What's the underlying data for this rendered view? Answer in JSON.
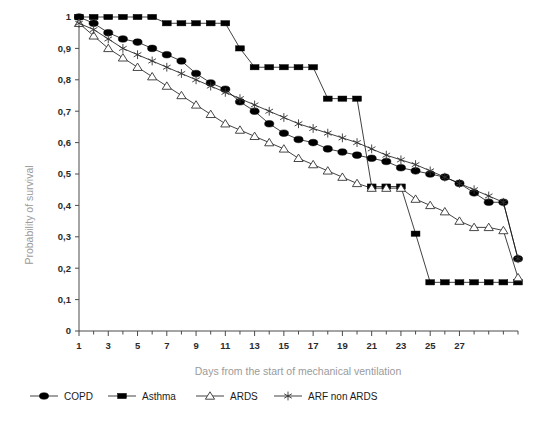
{
  "chart_data": {
    "type": "line",
    "title": "",
    "subtitle": "",
    "xlabel": "Days from the start of mechanical ventilation",
    "ylabel": "Probability of survival",
    "xlim": [
      1,
      31
    ],
    "ylim": [
      0,
      1
    ],
    "grid": false,
    "legend_position": "bottom-left",
    "x_tick_labels": [
      "1",
      "3",
      "5",
      "7",
      "9",
      "11",
      "13",
      "15",
      "17",
      "19",
      "21",
      "23",
      "25",
      "27"
    ],
    "x_tick_values": [
      1,
      3,
      5,
      7,
      9,
      11,
      13,
      15,
      17,
      19,
      21,
      23,
      25,
      27
    ],
    "x_minor_ticks": [
      2,
      4,
      6,
      8,
      10,
      12,
      14,
      16,
      18,
      20,
      22,
      24,
      26,
      28,
      29,
      30,
      31
    ],
    "y_tick_labels": [
      "0",
      "0,1",
      "0,2",
      "0,3",
      "0,4",
      "0,5",
      "0,6",
      "0,7",
      "0,8",
      "0,9",
      "1"
    ],
    "y_tick_values": [
      0,
      0.1,
      0.2,
      0.3,
      0.4,
      0.5,
      0.6,
      0.7,
      0.8,
      0.9,
      1
    ],
    "x": [
      1,
      2,
      3,
      4,
      5,
      6,
      7,
      8,
      9,
      10,
      11,
      12,
      13,
      14,
      15,
      16,
      17,
      18,
      19,
      20,
      21,
      22,
      23,
      24,
      25,
      26,
      27,
      28,
      29,
      30,
      31
    ],
    "series": [
      {
        "name": "COPD",
        "marker": "filled-circle",
        "color": "#000000",
        "values": [
          1.0,
          0.98,
          0.95,
          0.93,
          0.92,
          0.9,
          0.88,
          0.86,
          0.82,
          0.79,
          0.77,
          0.73,
          0.7,
          0.66,
          0.63,
          0.61,
          0.6,
          0.58,
          0.57,
          0.56,
          0.55,
          0.54,
          0.52,
          0.51,
          0.5,
          0.49,
          0.47,
          0.44,
          0.41,
          0.41,
          0.23
        ]
      },
      {
        "name": "Asthma",
        "marker": "filled-square",
        "color": "#000000",
        "values": [
          1.0,
          1.0,
          1.0,
          1.0,
          1.0,
          1.0,
          0.98,
          0.98,
          0.98,
          0.98,
          0.98,
          0.9,
          0.84,
          0.84,
          0.84,
          0.84,
          0.84,
          0.74,
          0.74,
          0.74,
          0.46,
          0.46,
          0.46,
          0.31,
          0.155,
          0.155,
          0.155,
          0.155,
          0.155,
          0.155,
          0.155
        ]
      },
      {
        "name": "ARDS",
        "marker": "open-triangle",
        "color": "#333333",
        "values": [
          0.98,
          0.94,
          0.9,
          0.87,
          0.84,
          0.81,
          0.78,
          0.75,
          0.72,
          0.69,
          0.66,
          0.64,
          0.62,
          0.6,
          0.58,
          0.55,
          0.53,
          0.51,
          0.49,
          0.47,
          0.455,
          0.455,
          0.455,
          0.42,
          0.4,
          0.38,
          0.35,
          0.33,
          0.33,
          0.32,
          0.17
        ]
      },
      {
        "name": "ARF non ARDS",
        "marker": "star",
        "color": "#333333",
        "values": [
          0.98,
          0.96,
          0.93,
          0.9,
          0.88,
          0.86,
          0.84,
          0.82,
          0.8,
          0.78,
          0.76,
          0.74,
          0.72,
          0.7,
          0.68,
          0.66,
          0.645,
          0.63,
          0.615,
          0.6,
          0.58,
          0.56,
          0.545,
          0.53,
          0.51,
          0.49,
          0.47,
          0.45,
          0.43,
          0.41,
          0.23
        ]
      }
    ]
  },
  "legend": {
    "items": [
      {
        "label": "COPD",
        "marker": "filled-circle"
      },
      {
        "label": "Asthma",
        "marker": "filled-square"
      },
      {
        "label": "ARDS",
        "marker": "open-triangle"
      },
      {
        "label": "ARF non ARDS",
        "marker": "star"
      }
    ]
  },
  "colors": {
    "axis": "#4a4a4a",
    "tick_text": "#2b2b2b",
    "axis_title": "#9b9b9b",
    "series_line": "#111111",
    "background": "#ffffff"
  }
}
